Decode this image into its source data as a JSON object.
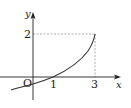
{
  "figure": {
    "type": "function-graph",
    "axes": {
      "x_label": "x",
      "y_label": "y",
      "origin_label": "O"
    },
    "ticks": {
      "x": [
        "1",
        "3"
      ],
      "y": [
        "2"
      ]
    },
    "curve": {
      "description": "increasing concave-up curve passing through (1,0) and ending at (3,2)",
      "points": [
        [
          -0.8,
          -0.45
        ],
        [
          0,
          -0.25
        ],
        [
          1,
          0
        ],
        [
          2,
          0.7
        ],
        [
          2.6,
          1.3
        ],
        [
          3,
          2
        ]
      ],
      "endpoint": [
        3,
        2
      ],
      "x_intercept": 1
    },
    "guides": {
      "horizontal_dashed": "y = 2 from x = 0 to x = 3",
      "vertical_dashed": "x = 3 from y = 0 to y = 2"
    },
    "colors": {
      "axis": "#222222",
      "curve": "#333333",
      "guide": "#999999"
    }
  }
}
